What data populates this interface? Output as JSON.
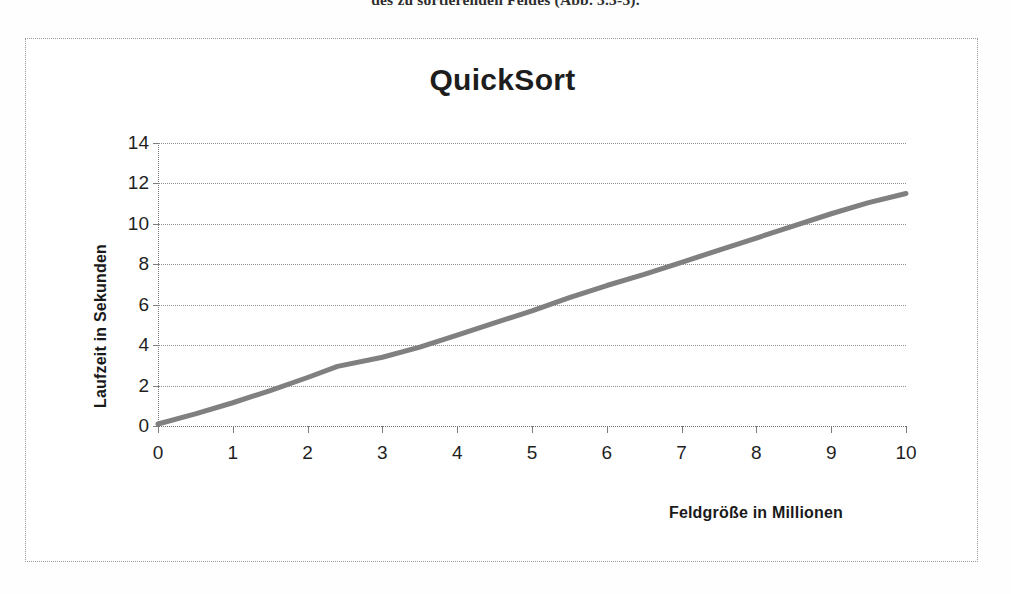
{
  "document": {
    "cropped_text_line": "des zu sortierenden Feldes (Abb. 3.3-3)."
  },
  "figure": {
    "frame_style": "dotted-border",
    "colors": {
      "line": "#808080",
      "grid": "#8d8d8d",
      "text": "#1f1f1f",
      "background": "#ffffff"
    }
  },
  "chart_data": {
    "type": "line",
    "title": "QuickSort",
    "xlabel": "Feldgröße in Millionen",
    "ylabel": "Laufzeit in Sekunden",
    "xlim": [
      0,
      10
    ],
    "ylim": [
      0,
      14
    ],
    "xticks": [
      "0",
      "1",
      "2",
      "3",
      "4",
      "5",
      "6",
      "7",
      "8",
      "9",
      "10"
    ],
    "yticks": [
      "0",
      "2",
      "4",
      "6",
      "8",
      "10",
      "12",
      "14"
    ],
    "xtick_values": [
      0,
      1,
      2,
      3,
      4,
      5,
      6,
      7,
      8,
      9,
      10
    ],
    "ytick_values": [
      0,
      2,
      4,
      6,
      8,
      10,
      12,
      14
    ],
    "grid": "horizontal-dotted",
    "legend": "none",
    "series": [
      {
        "name": "QuickSort",
        "color": "#808080",
        "line_width": 5,
        "x": [
          0,
          0.5,
          1,
          1.5,
          2,
          2.4,
          3,
          3.5,
          4,
          4.5,
          5,
          5.5,
          6,
          6.5,
          7,
          7.5,
          8,
          8.5,
          9,
          9.5,
          10
        ],
        "values": [
          0.1,
          0.6,
          1.15,
          1.75,
          2.4,
          2.95,
          3.4,
          3.9,
          4.5,
          5.1,
          5.7,
          6.35,
          6.95,
          7.5,
          8.1,
          8.7,
          9.3,
          9.9,
          10.5,
          11.05,
          11.5
        ]
      }
    ]
  }
}
